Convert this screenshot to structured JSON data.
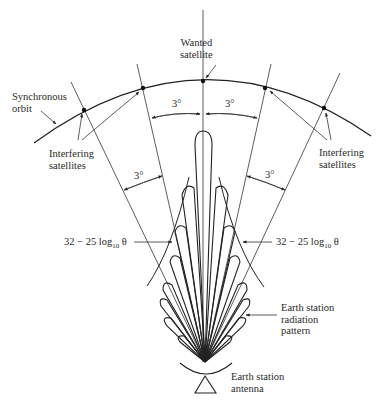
{
  "labels": {
    "wanted_satellite": [
      "Wanted",
      "satellite"
    ],
    "synchronous_orbit": [
      "Synchronous",
      "orbit"
    ],
    "interfering_left": [
      "Interfering",
      "satellites"
    ],
    "interfering_right": [
      "Interfering",
      "satellites"
    ],
    "radiation_pattern": [
      "Earth station",
      "radiation",
      "pattern"
    ],
    "antenna": [
      "Earth station",
      "antenna"
    ]
  },
  "angles": {
    "top_left": "3°",
    "top_right": "3°",
    "side_left": "3°",
    "side_right": "3°"
  },
  "envelope_formula": {
    "prefix": "32 − 25 log",
    "subscript": "10",
    "variable": "θ"
  },
  "colors": {
    "line": "#222222",
    "text": "#2a2a2a",
    "background": "#ffffff"
  }
}
